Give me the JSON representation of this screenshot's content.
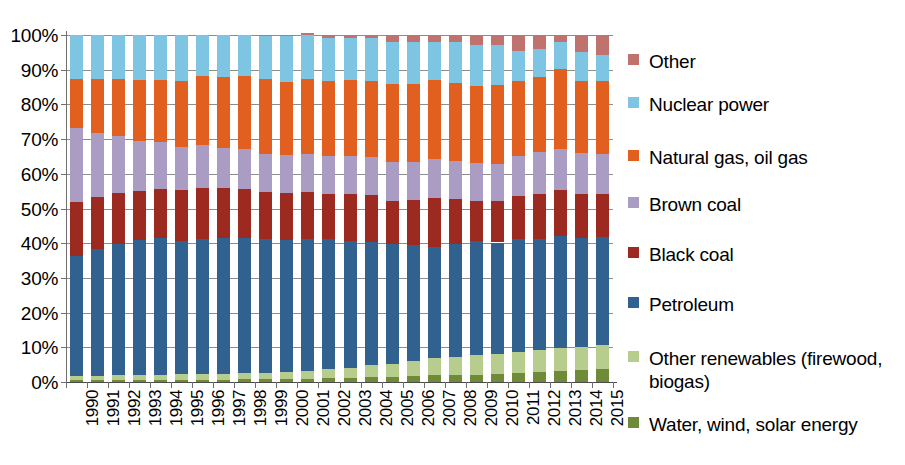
{
  "chart_data": {
    "type": "bar",
    "subtype": "stacked-100-percent",
    "title": "",
    "subtitle": "",
    "xlabel": "",
    "ylabel": "",
    "ylim": [
      0,
      100
    ],
    "y_tick_labels": [
      "0%",
      "10%",
      "20%",
      "30%",
      "40%",
      "50%",
      "60%",
      "70%",
      "80%",
      "90%",
      "100%"
    ],
    "y_tick_values": [
      0,
      10,
      20,
      30,
      40,
      50,
      60,
      70,
      80,
      90,
      100
    ],
    "grid": true,
    "legend_position": "right",
    "categories": [
      "1990",
      "1991",
      "1992",
      "1993",
      "1994",
      "1995",
      "1996",
      "1997",
      "1998",
      "1999",
      "2000",
      "2001",
      "2002",
      "2003",
      "2004",
      "2005",
      "2006",
      "2007",
      "2008",
      "2009",
      "2010",
      "2011",
      "2012",
      "2013",
      "2014",
      "2015"
    ],
    "stack_order_bottom_to_top": [
      "Water, wind, solar energy",
      "Other renewables (firewood, biogas)",
      "Petroleum",
      "Black coal",
      "Brown coal",
      "Natural gas, oil gas",
      "Nuclear power",
      "Other"
    ],
    "series": [
      {
        "name": "Water, wind, solar energy",
        "color": "#6f8b3a",
        "values": [
          0.5,
          0.5,
          0.5,
          0.6,
          0.6,
          0.7,
          0.7,
          0.7,
          0.8,
          0.8,
          0.9,
          1.0,
          1.1,
          1.2,
          1.4,
          1.5,
          1.7,
          1.9,
          2.0,
          2.1,
          2.3,
          2.7,
          3.0,
          3.2,
          3.5,
          3.8
        ]
      },
      {
        "name": "Other renewables (firewood, biogas)",
        "color": "#b6cd8e",
        "values": [
          1.3,
          1.3,
          1.4,
          1.4,
          1.5,
          1.5,
          1.6,
          1.7,
          1.8,
          1.9,
          2.1,
          2.3,
          2.6,
          2.9,
          3.4,
          3.8,
          4.3,
          5.0,
          5.3,
          5.6,
          5.9,
          6.0,
          6.3,
          6.5,
          6.6,
          7.0
        ]
      },
      {
        "name": "Petroleum",
        "color": "#31618f",
        "values": [
          34.5,
          36.5,
          38.0,
          39.0,
          39.5,
          38.5,
          39.0,
          39.0,
          39.0,
          38.5,
          38.0,
          38.0,
          37.5,
          36.5,
          35.5,
          34.5,
          33.5,
          32.0,
          32.5,
          33.0,
          32.0,
          32.5,
          32.0,
          32.5,
          31.5,
          31.0
        ]
      },
      {
        "name": "Black coal",
        "color": "#9c2a20",
        "values": [
          15.5,
          15.0,
          14.5,
          14.0,
          14.0,
          14.5,
          14.5,
          14.5,
          14.0,
          13.5,
          13.5,
          13.5,
          13.0,
          13.5,
          13.5,
          12.5,
          13.0,
          14.0,
          13.0,
          11.5,
          12.0,
          12.5,
          13.0,
          13.0,
          12.5,
          12.5
        ]
      },
      {
        "name": "Brown coal",
        "color": "#ab9cc4",
        "values": [
          21.5,
          18.5,
          16.5,
          14.5,
          13.5,
          12.5,
          12.5,
          11.5,
          11.5,
          11.0,
          11.0,
          11.0,
          11.0,
          11.0,
          11.0,
          11.0,
          11.0,
          11.5,
          11.0,
          11.0,
          10.5,
          11.5,
          12.0,
          12.0,
          12.0,
          11.5
        ]
      },
      {
        "name": "Natural gas, oil gas",
        "color": "#e2601f",
        "values": [
          14.0,
          15.5,
          16.5,
          17.5,
          18.0,
          19.0,
          20.0,
          20.5,
          21.0,
          21.5,
          21.0,
          21.5,
          21.5,
          22.0,
          22.0,
          22.5,
          22.5,
          22.5,
          22.5,
          22.0,
          23.0,
          21.5,
          21.5,
          23.0,
          20.5,
          21.0
        ]
      },
      {
        "name": "Nuclear power",
        "color": "#7ec4e3",
        "values": [
          12.7,
          12.7,
          12.6,
          13.0,
          12.9,
          13.3,
          11.7,
          12.1,
          11.9,
          12.7,
          13.5,
          12.7,
          12.3,
          11.9,
          12.2,
          12.2,
          12.0,
          11.1,
          11.7,
          11.8,
          11.3,
          8.8,
          8.2,
          7.8,
          8.4,
          7.3
        ]
      },
      {
        "name": "Other",
        "color": "#c0736e",
        "values": [
          0.0,
          0.0,
          0.0,
          0.0,
          0.0,
          0.0,
          0.0,
          0.0,
          0.0,
          0.1,
          0.1,
          0.5,
          1.0,
          1.0,
          1.0,
          2.0,
          2.0,
          2.0,
          2.0,
          3.0,
          3.0,
          4.5,
          4.0,
          2.0,
          5.0,
          5.9
        ]
      }
    ]
  },
  "legend": {
    "items": [
      {
        "label": "Other",
        "color": "#c0736e"
      },
      {
        "label": "Nuclear power",
        "color": "#7ec4e3"
      },
      {
        "label": "Natural gas, oil gas",
        "color": "#e2601f"
      },
      {
        "label": "Brown coal",
        "color": "#ab9cc4"
      },
      {
        "label": "Black coal",
        "color": "#9c2a20"
      },
      {
        "label": "Petroleum",
        "color": "#31618f"
      },
      {
        "label": "Other renewables (firewood,\nbiogas)",
        "color": "#b6cd8e"
      },
      {
        "label": "Water, wind, solar energy",
        "color": "#6f8b3a"
      }
    ]
  }
}
